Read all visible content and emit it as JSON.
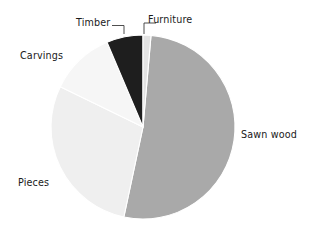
{
  "chart_data": {
    "type": "pie",
    "title": "",
    "subtitle": "",
    "xlabel": "",
    "ylabel": "",
    "legend_position": "none",
    "grid": false,
    "labels_outside": true,
    "categories": [
      "Furniture",
      "Sawn wood",
      "Pieces",
      "Carvings",
      "Timber"
    ],
    "values": [
      1.5,
      52,
      29,
      11.5,
      6
    ],
    "units": "percent",
    "slices": [
      {
        "label": "Furniture",
        "value": 1.5,
        "color": "#e3e3e3",
        "start_angle_deg": 0,
        "end_angle_deg": 5,
        "has_leader_line": true
      },
      {
        "label": "Sawn wood",
        "value": 52,
        "color": "#a9a9a9",
        "start_angle_deg": 5,
        "end_angle_deg": 192,
        "has_leader_line": false
      },
      {
        "label": "Pieces",
        "value": 29,
        "color": "#efefef",
        "start_angle_deg": 192,
        "end_angle_deg": 296,
        "has_leader_line": false
      },
      {
        "label": "Carvings",
        "value": 11.5,
        "color": "#f6f6f6",
        "start_angle_deg": 296,
        "end_angle_deg": 337,
        "has_leader_line": false
      },
      {
        "label": "Timber",
        "value": 6,
        "color": "#1e1e1e",
        "start_angle_deg": 337,
        "end_angle_deg": 360,
        "has_leader_line": true
      }
    ]
  },
  "labels": {
    "sawn_wood": "Sawn wood",
    "pieces": "Pieces",
    "carvings": "Carvings",
    "timber": "Timber",
    "furniture": "Furniture"
  },
  "colors": {
    "background": "#ffffff",
    "text": "#1a1a1a",
    "leader": "#3b3b3b",
    "slice_sawn_wood": "#a9a9a9",
    "slice_pieces": "#efefef",
    "slice_carvings": "#f6f6f6",
    "slice_timber": "#1e1e1e",
    "slice_furniture": "#e3e3e3"
  }
}
